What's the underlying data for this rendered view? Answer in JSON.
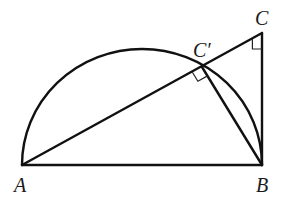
{
  "diagram": {
    "type": "geometry",
    "points": {
      "A": {
        "label": "A",
        "x": 22,
        "y": 165
      },
      "B": {
        "label": "B",
        "x": 262,
        "y": 165
      },
      "C": {
        "label": "C",
        "x": 262,
        "y": 33
      },
      "Cprime": {
        "label": "C′",
        "x": 202,
        "y": 67
      }
    },
    "labels": {
      "A": "A",
      "B": "B",
      "C": "C",
      "Cprime": "C′"
    },
    "segments": [
      {
        "from": "A",
        "to": "B"
      },
      {
        "from": "B",
        "to": "C"
      },
      {
        "from": "A",
        "to": "C"
      },
      {
        "from": "B",
        "to": "Cprime"
      }
    ],
    "arcs": [
      {
        "type": "semicircle",
        "diameter": [
          "A",
          "B"
        ]
      }
    ],
    "right_angles": [
      {
        "at": "C",
        "between": [
          "A",
          "B"
        ]
      },
      {
        "at": "Cprime",
        "between": [
          "A",
          "B"
        ]
      }
    ],
    "colors": {
      "stroke": "#111111",
      "background": "#ffffff"
    }
  }
}
